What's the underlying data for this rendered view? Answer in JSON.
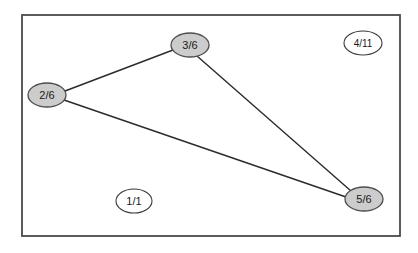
{
  "diagram": {
    "frame": {
      "x": 21,
      "y": 14,
      "width": 379,
      "height": 222,
      "stroke_color": "#4a4a4a",
      "fill_color": "#ffffff",
      "stroke_width": 2
    },
    "style": {
      "filled_node_fill": "#cccccc",
      "filled_node_stroke": "#4d4d4d",
      "open_node_fill": "#ffffff",
      "open_node_stroke": "#3a3a3a",
      "edge_color": "#2b2b2b",
      "edge_width": 1.4,
      "label_color": "#1a1a1a"
    },
    "nodes": [
      {
        "id": "n2",
        "label": "2/6",
        "cx": 47,
        "cy": 95,
        "rx": 19,
        "ry": 12,
        "filled": true
      },
      {
        "id": "n3",
        "label": "3/6",
        "cx": 190,
        "cy": 45,
        "rx": 19,
        "ry": 12,
        "filled": true
      },
      {
        "id": "n5",
        "label": "5/6",
        "cx": 364,
        "cy": 199,
        "rx": 19,
        "ry": 12,
        "filled": true
      },
      {
        "id": "n4",
        "label": "4/11",
        "cx": 363,
        "cy": 43,
        "rx": 19,
        "ry": 12,
        "filled": false
      },
      {
        "id": "n1",
        "label": "1/1",
        "cx": 134,
        "cy": 201,
        "rx": 18,
        "ry": 12,
        "filled": false
      }
    ],
    "edges": [
      {
        "id": "e-2-3",
        "from": "2/6",
        "to": "3/6",
        "x1": 65,
        "y1": 91,
        "x2": 173,
        "y2": 50
      },
      {
        "id": "e-2-5",
        "from": "2/6",
        "to": "5/6",
        "x1": 64,
        "y1": 100,
        "x2": 346,
        "y2": 197
      },
      {
        "id": "e-3-5",
        "from": "3/6",
        "to": "5/6",
        "x1": 197,
        "y1": 56,
        "x2": 351,
        "y2": 191
      }
    ]
  }
}
